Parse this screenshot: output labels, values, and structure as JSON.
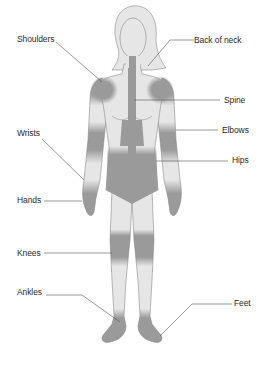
{
  "diagram": {
    "title": "",
    "colors": {
      "body_fill": "#e6e6e6",
      "body_outline": "#8a8a8a",
      "affected_fill": "#9a9a9a",
      "leader_line": "#555555",
      "label_text": "#2a2a2a",
      "background": "#ffffff"
    },
    "labels": {
      "shoulders": "Shoulders",
      "back_of_neck": "Back of neck",
      "spine": "Spine",
      "elbows": "Elbows",
      "wrists": "Wrists",
      "hips": "Hips",
      "hands": "Hands",
      "knees": "Knees",
      "ankles": "Ankles",
      "feet": "Feet"
    },
    "affected_regions": [
      "Shoulders",
      "Back of neck",
      "Spine",
      "Elbows",
      "Wrists",
      "Hips",
      "Hands",
      "Knees",
      "Ankles",
      "Feet"
    ]
  }
}
